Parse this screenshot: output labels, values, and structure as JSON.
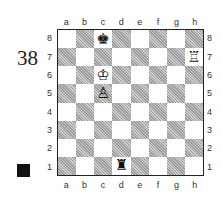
{
  "diagram": {
    "number": "38",
    "side_to_move": "black",
    "files": [
      "a",
      "b",
      "c",
      "d",
      "e",
      "f",
      "g",
      "h"
    ],
    "ranks": [
      "8",
      "7",
      "6",
      "5",
      "4",
      "3",
      "2",
      "1"
    ],
    "pieces": [
      {
        "square": "c8",
        "piece": "black-king",
        "glyph": "♚"
      },
      {
        "square": "h7",
        "piece": "white-rook",
        "glyph": "♖"
      },
      {
        "square": "c6",
        "piece": "white-king",
        "glyph": "♔"
      },
      {
        "square": "c5",
        "piece": "white-pawn",
        "glyph": "♙"
      },
      {
        "square": "d1",
        "piece": "black-rook",
        "glyph": "♜"
      }
    ],
    "colors": {
      "light": "#ffffff",
      "dark": "#b8b8b8",
      "border": "#222222"
    }
  }
}
